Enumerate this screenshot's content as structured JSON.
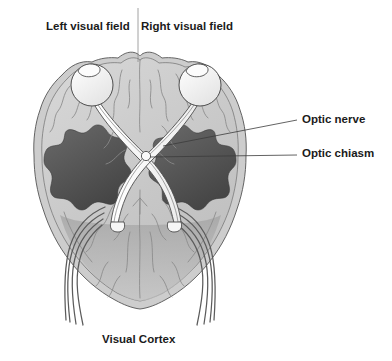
{
  "figure": {
    "title_hidden": "",
    "canvas": {
      "width": 392,
      "height": 361,
      "background": "#ffffff"
    }
  },
  "labels": {
    "left_visual_field": "Left visual field",
    "right_visual_field": "Right visual field",
    "optic_nerve": "Optic nerve",
    "optic_chiasm": "Optic chiasm",
    "visual_cortex": "Visual Cortex"
  },
  "colors": {
    "text": "#1b1b1b",
    "outline": "#4a4a4a",
    "brain_outer": "#cfcfcf",
    "brain_mid": "#c2c2c2",
    "brain_inner": "#b4b4b4",
    "occipital_fill": "#a9a9a9",
    "temporal_dark": "#4f4f4f",
    "temporal_dark2": "#5d5d5d",
    "eye_fill": "#f2f2f2",
    "nerve_fill": "#fbfbfb",
    "sulci": "#8f8f8f",
    "tract_stroke": "#5b5b5b",
    "leader": "#3b3b3b",
    "divider": "#8a8a8a"
  },
  "structures": {
    "eyes": [
      {
        "name": "left-eye",
        "cx": 92,
        "cy": 85,
        "r": 21
      },
      {
        "name": "right-eye",
        "cx": 200,
        "cy": 85,
        "r": 21
      }
    ],
    "optic_chiasm": {
      "x": 146,
      "y": 156
    },
    "temporal_lobes": [
      {
        "name": "left-temporal-lobe"
      },
      {
        "name": "right-temporal-lobe"
      }
    ],
    "optic_radiations_per_side": 4
  },
  "leader_lines": {
    "optic_nerve": {
      "from_x": 163,
      "from_y": 146,
      "to_x": 297,
      "to_y": 120
    },
    "optic_chiasm": {
      "from_x": 150,
      "from_y": 157,
      "to_x": 297,
      "to_y": 155
    },
    "midline_divider": {
      "x": 138,
      "y1": 8,
      "y2": 62
    }
  }
}
